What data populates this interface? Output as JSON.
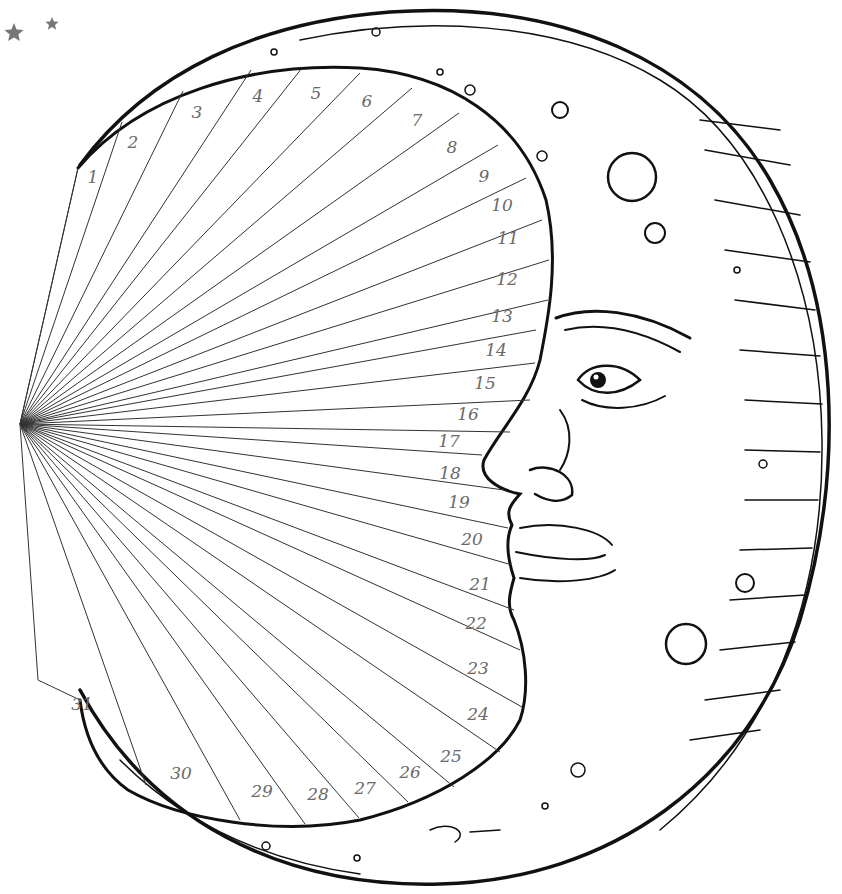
{
  "illustration": {
    "subject": "Crescent moon with face — 31-day tracker",
    "ray_origin": [
      20,
      424
    ],
    "ink_color": "#111111",
    "number_color": "#6a6a6a",
    "star_color": "#777777"
  },
  "days": [
    {
      "label": "1",
      "x": 93,
      "y": 183,
      "ex": 78,
      "ey": 168
    },
    {
      "label": "2",
      "x": 133,
      "y": 148,
      "ex": 122,
      "ey": 122
    },
    {
      "label": "3",
      "x": 197,
      "y": 118,
      "ex": 183,
      "ey": 91
    },
    {
      "label": "4",
      "x": 258,
      "y": 102,
      "ex": 251,
      "ey": 70
    },
    {
      "label": "5",
      "x": 316,
      "y": 99,
      "ex": 302,
      "ey": 68
    },
    {
      "label": "6",
      "x": 367,
      "y": 107,
      "ex": 360,
      "ey": 73
    },
    {
      "label": "7",
      "x": 417,
      "y": 126,
      "ex": 412,
      "ey": 88
    },
    {
      "label": "8",
      "x": 452,
      "y": 153,
      "ex": 459,
      "ey": 113
    },
    {
      "label": "9",
      "x": 484,
      "y": 182,
      "ex": 498,
      "ey": 145
    },
    {
      "label": "10",
      "x": 502,
      "y": 211,
      "ex": 526,
      "ey": 178
    },
    {
      "label": "11",
      "x": 508,
      "y": 244,
      "ex": 542,
      "ey": 220
    },
    {
      "label": "12",
      "x": 507,
      "y": 285,
      "ex": 549,
      "ey": 260
    },
    {
      "label": "13",
      "x": 502,
      "y": 322,
      "ex": 548,
      "ey": 300
    },
    {
      "label": "14",
      "x": 496,
      "y": 356,
      "ex": 536,
      "ey": 330
    },
    {
      "label": "15",
      "x": 485,
      "y": 389,
      "ex": 535,
      "ey": 363
    },
    {
      "label": "16",
      "x": 468,
      "y": 420,
      "ex": 530,
      "ey": 400
    },
    {
      "label": "17",
      "x": 449,
      "y": 447,
      "ex": 510,
      "ey": 432
    },
    {
      "label": "18",
      "x": 450,
      "y": 479,
      "ex": 482,
      "ey": 455
    },
    {
      "label": "19",
      "x": 459,
      "y": 508,
      "ex": 504,
      "ey": 490
    },
    {
      "label": "20",
      "x": 472,
      "y": 545,
      "ex": 508,
      "ey": 528
    },
    {
      "label": "21",
      "x": 480,
      "y": 590,
      "ex": 512,
      "ey": 565
    },
    {
      "label": "22",
      "x": 476,
      "y": 629,
      "ex": 514,
      "ey": 610
    },
    {
      "label": "23",
      "x": 478,
      "y": 674,
      "ex": 520,
      "ey": 650
    },
    {
      "label": "24",
      "x": 478,
      "y": 720,
      "ex": 522,
      "ey": 707
    },
    {
      "label": "25",
      "x": 451,
      "y": 762,
      "ex": 500,
      "ey": 752
    },
    {
      "label": "26",
      "x": 410,
      "y": 778,
      "ex": 454,
      "ey": 787
    },
    {
      "label": "27",
      "x": 365,
      "y": 794,
      "ex": 408,
      "ey": 802
    },
    {
      "label": "28",
      "x": 318,
      "y": 800,
      "ex": 359,
      "ey": 818
    },
    {
      "label": "29",
      "x": 262,
      "y": 797,
      "ex": 305,
      "ey": 824
    },
    {
      "label": "30",
      "x": 181,
      "y": 779,
      "ex": 240,
      "ey": 820
    },
    {
      "label": "31",
      "x": 82,
      "y": 710,
      "ex": 146,
      "ey": 785
    }
  ],
  "stars": [
    {
      "x": 14,
      "y": 33,
      "r": 10
    },
    {
      "x": 52,
      "y": 24,
      "r": 7
    }
  ]
}
